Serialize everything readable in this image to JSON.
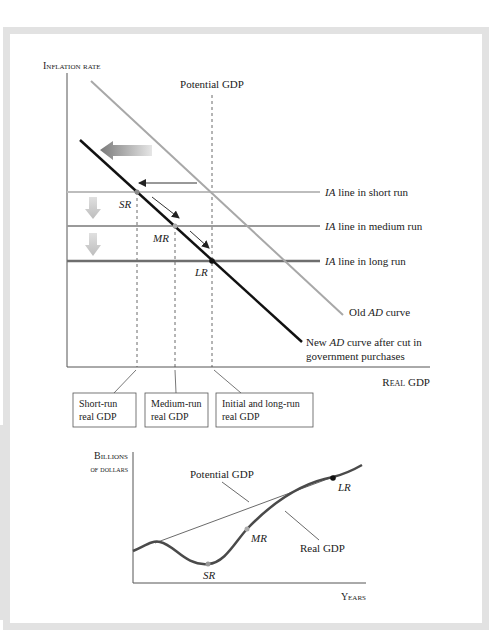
{
  "top_chart": {
    "y_axis_label": "Inflation rate",
    "x_axis_label": "Real GDP",
    "potential_gdp_label": "Potential GDP",
    "ia_short": {
      "italic": "IA",
      "rest": " line in short run"
    },
    "ia_medium": {
      "italic": "IA",
      "rest": " line in medium run"
    },
    "ia_long": {
      "italic": "IA",
      "rest": " line in long run"
    },
    "old_ad": {
      "pre": "Old ",
      "italic": "AD",
      "rest": " curve"
    },
    "new_ad": {
      "pre": "New ",
      "italic": "AD",
      "rest": " curve after cut in",
      "line2": "government purchases"
    },
    "points": {
      "sr": "SR",
      "mr": "MR",
      "lr": "LR"
    },
    "boxes": [
      {
        "line1": "Short-run",
        "line2": "real GDP"
      },
      {
        "line1": "Medium-run",
        "line2": "real GDP"
      },
      {
        "line1": "Initial and long-run",
        "line2": "real GDP"
      }
    ]
  },
  "bottom_chart": {
    "y_axis_label_1": "Billions",
    "y_axis_label_2": "of dollars",
    "x_axis_label": "Years",
    "potential_gdp_label": "Potential GDP",
    "real_gdp_label": "Real GDP",
    "points": {
      "sr": "SR",
      "mr": "MR",
      "lr": "LR"
    }
  },
  "colors": {
    "ia_short": "#bdbdbd",
    "ia_medium": "#9a9a9a",
    "ia_long": "#6e6e6e",
    "old_ad": "#a8a8a8",
    "new_ad": "#111111",
    "real_gdp": "#4a4a4a"
  }
}
